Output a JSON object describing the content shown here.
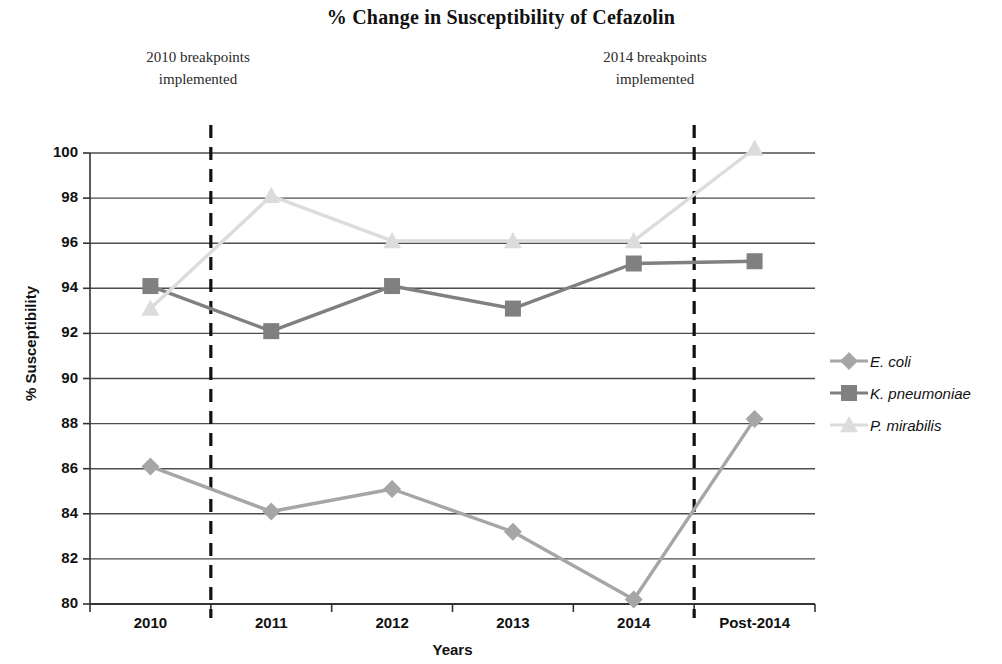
{
  "chart_data": {
    "type": "line",
    "title": "% Change in Susceptibility of Cefazolin",
    "xlabel": "Years",
    "ylabel": "% Susceptibility",
    "categories": [
      "2010",
      "2011",
      "2012",
      "2013",
      "2014",
      "Post-2014"
    ],
    "ylim": [
      80,
      100
    ],
    "yticks": [
      80,
      82,
      84,
      86,
      88,
      90,
      92,
      94,
      96,
      98,
      100
    ],
    "grid": "horizontal",
    "legend_position": "right",
    "series": [
      {
        "name": "E. coli",
        "marker": "diamond",
        "color": "#a6a6a6",
        "values": [
          86.1,
          84.1,
          85.1,
          83.2,
          80.2,
          88.2
        ]
      },
      {
        "name": "K. pneumoniae",
        "marker": "square",
        "color": "#808080",
        "values": [
          94.1,
          92.1,
          94.1,
          93.1,
          95.1,
          95.2
        ]
      },
      {
        "name": "P. mirabilis",
        "marker": "triangle",
        "color": "#dcdcdc",
        "values": [
          93.1,
          98.1,
          96.1,
          96.1,
          96.1,
          100.2
        ]
      }
    ],
    "annotations": [
      {
        "id": "breakpoints-2010",
        "line1": "2010 breakpoints",
        "line2": "implemented",
        "at_x_between": [
          "2010",
          "2011"
        ],
        "style": "dashed-vertical-line"
      },
      {
        "id": "breakpoints-2014",
        "line1": "2014 breakpoints",
        "line2": "implemented",
        "at_x_between": [
          "2014",
          "Post-2014"
        ],
        "style": "dashed-vertical-line"
      }
    ]
  }
}
